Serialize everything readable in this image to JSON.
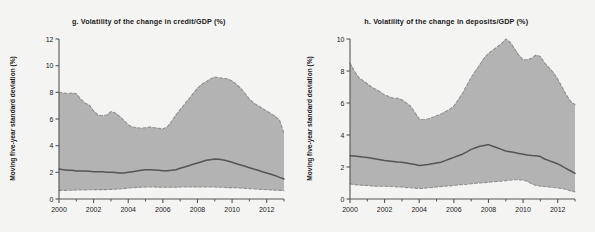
{
  "figure": {
    "background_color": "#f4f4f2",
    "band_color": "#b3b3b3",
    "line_color": "#555555",
    "dash_color": "#8f8f8f",
    "axis_color": "#555555"
  },
  "panels": [
    {
      "key": "panel-g",
      "title": "g. Volatility of the change in credit/GDP (%)",
      "ylabel": "Moving five-year standard deviation (%)"
    },
    {
      "key": "panel-h",
      "title": "h. Volatility of the change in deposits/GDP (%)",
      "ylabel": "Moving five-year standard deviation (%)"
    }
  ],
  "chart_data": [
    {
      "type": "area",
      "panel": "g",
      "title": "g. Volatility of the change in credit/GDP (%)",
      "xlabel": "",
      "ylabel": "Moving five-year standard deviation (%)",
      "xlim": [
        2000,
        2013
      ],
      "ylim": [
        0,
        12
      ],
      "yticks": [
        0,
        2,
        4,
        6,
        8,
        10,
        12
      ],
      "xticks": [
        2000,
        2002,
        2004,
        2006,
        2008,
        2010,
        2012
      ],
      "xminorticks": [
        2001,
        2003,
        2005,
        2007,
        2009,
        2011,
        2013
      ],
      "grid": false,
      "legend": "none",
      "x": [
        2000.0,
        2000.25,
        2000.5,
        2000.75,
        2001.0,
        2001.25,
        2001.5,
        2001.75,
        2002.0,
        2002.25,
        2002.5,
        2002.75,
        2003.0,
        2003.25,
        2003.5,
        2003.75,
        2004.0,
        2004.25,
        2004.5,
        2004.75,
        2005.0,
        2005.25,
        2005.5,
        2005.75,
        2006.0,
        2006.25,
        2006.5,
        2006.75,
        2007.0,
        2007.25,
        2007.5,
        2007.75,
        2008.0,
        2008.25,
        2008.5,
        2008.75,
        2009.0,
        2009.25,
        2009.5,
        2009.75,
        2010.0,
        2010.25,
        2010.5,
        2010.75,
        2011.0,
        2011.25,
        2011.5,
        2011.75,
        2012.0,
        2012.25,
        2012.5,
        2012.75,
        2013.0
      ],
      "series": [
        {
          "name": "Upper bound (75th percentile)",
          "style": "dashed",
          "values": [
            8.0,
            7.95,
            7.9,
            7.95,
            7.9,
            7.5,
            7.2,
            7.05,
            6.6,
            6.3,
            6.25,
            6.3,
            6.55,
            6.45,
            6.2,
            5.9,
            5.55,
            5.4,
            5.35,
            5.3,
            5.35,
            5.4,
            5.35,
            5.3,
            5.25,
            5.4,
            5.8,
            6.3,
            6.7,
            7.1,
            7.5,
            7.9,
            8.3,
            8.6,
            8.8,
            9.0,
            9.15,
            9.1,
            9.05,
            9.0,
            8.85,
            8.6,
            8.3,
            7.9,
            7.5,
            7.2,
            7.0,
            6.8,
            6.6,
            6.4,
            6.2,
            5.9,
            4.9
          ]
        },
        {
          "name": "Median",
          "style": "solid",
          "values": [
            2.25,
            2.2,
            2.15,
            2.15,
            2.1,
            2.1,
            2.1,
            2.08,
            2.05,
            2.05,
            2.05,
            2.0,
            2.0,
            1.98,
            1.95,
            1.95,
            2.0,
            2.05,
            2.1,
            2.15,
            2.2,
            2.2,
            2.18,
            2.15,
            2.12,
            2.12,
            2.15,
            2.2,
            2.3,
            2.4,
            2.5,
            2.6,
            2.7,
            2.8,
            2.9,
            2.95,
            3.0,
            2.98,
            2.92,
            2.85,
            2.75,
            2.65,
            2.55,
            2.45,
            2.35,
            2.25,
            2.15,
            2.05,
            1.95,
            1.85,
            1.75,
            1.62,
            1.5
          ]
        },
        {
          "name": "Lower bound (25th percentile)",
          "style": "dashed",
          "values": [
            0.65,
            0.65,
            0.65,
            0.66,
            0.67,
            0.68,
            0.68,
            0.69,
            0.7,
            0.7,
            0.7,
            0.7,
            0.72,
            0.73,
            0.75,
            0.78,
            0.82,
            0.85,
            0.87,
            0.88,
            0.9,
            0.9,
            0.9,
            0.88,
            0.88,
            0.88,
            0.88,
            0.88,
            0.9,
            0.9,
            0.9,
            0.9,
            0.9,
            0.9,
            0.9,
            0.9,
            0.9,
            0.88,
            0.88,
            0.85,
            0.85,
            0.85,
            0.82,
            0.8,
            0.78,
            0.76,
            0.74,
            0.72,
            0.7,
            0.68,
            0.66,
            0.65,
            0.62
          ]
        }
      ]
    },
    {
      "type": "area",
      "panel": "h",
      "title": "h. Volatility of the change in deposits/GDP (%)",
      "xlabel": "",
      "ylabel": "Moving five-year standard deviation (%)",
      "xlim": [
        2000,
        2013
      ],
      "ylim": [
        0,
        10
      ],
      "yticks": [
        0,
        2,
        4,
        6,
        8,
        10
      ],
      "xticks": [
        2000,
        2002,
        2004,
        2006,
        2008,
        2010,
        2012
      ],
      "xminorticks": [
        2001,
        2003,
        2005,
        2007,
        2009,
        2011,
        2013
      ],
      "grid": false,
      "legend": "none",
      "x": [
        2000.0,
        2000.25,
        2000.5,
        2000.75,
        2001.0,
        2001.25,
        2001.5,
        2001.75,
        2002.0,
        2002.25,
        2002.5,
        2002.75,
        2003.0,
        2003.25,
        2003.5,
        2003.75,
        2004.0,
        2004.25,
        2004.5,
        2004.75,
        2005.0,
        2005.25,
        2005.5,
        2005.75,
        2006.0,
        2006.25,
        2006.5,
        2006.75,
        2007.0,
        2007.25,
        2007.5,
        2007.75,
        2008.0,
        2008.25,
        2008.5,
        2008.75,
        2009.0,
        2009.25,
        2009.5,
        2009.75,
        2010.0,
        2010.25,
        2010.5,
        2010.75,
        2011.0,
        2011.25,
        2011.5,
        2011.75,
        2012.0,
        2012.25,
        2012.5,
        2012.75,
        2013.0
      ],
      "series": [
        {
          "name": "Upper bound (75th percentile)",
          "style": "dashed",
          "values": [
            8.5,
            8.0,
            7.6,
            7.4,
            7.2,
            7.0,
            6.85,
            6.7,
            6.5,
            6.4,
            6.3,
            6.3,
            6.2,
            6.0,
            5.8,
            5.4,
            5.0,
            4.95,
            5.0,
            5.1,
            5.2,
            5.3,
            5.45,
            5.6,
            5.8,
            6.2,
            6.6,
            7.1,
            7.6,
            8.0,
            8.4,
            8.8,
            9.1,
            9.3,
            9.5,
            9.7,
            10.0,
            9.8,
            9.4,
            9.0,
            8.7,
            8.7,
            8.8,
            9.0,
            8.9,
            8.5,
            8.2,
            7.9,
            7.5,
            7.0,
            6.5,
            6.1,
            5.9
          ]
        },
        {
          "name": "Median",
          "style": "solid",
          "values": [
            2.7,
            2.68,
            2.65,
            2.62,
            2.6,
            2.55,
            2.5,
            2.45,
            2.4,
            2.38,
            2.35,
            2.32,
            2.3,
            2.25,
            2.2,
            2.15,
            2.1,
            2.12,
            2.15,
            2.2,
            2.25,
            2.3,
            2.4,
            2.5,
            2.6,
            2.7,
            2.8,
            2.95,
            3.1,
            3.2,
            3.3,
            3.35,
            3.4,
            3.3,
            3.2,
            3.1,
            3.0,
            2.95,
            2.9,
            2.85,
            2.8,
            2.75,
            2.72,
            2.7,
            2.65,
            2.5,
            2.4,
            2.3,
            2.2,
            2.05,
            1.9,
            1.75,
            1.6
          ]
        },
        {
          "name": "Lower bound (25th percentile)",
          "style": "dashed",
          "values": [
            0.95,
            0.9,
            0.88,
            0.85,
            0.85,
            0.82,
            0.8,
            0.8,
            0.8,
            0.78,
            0.78,
            0.75,
            0.75,
            0.72,
            0.7,
            0.68,
            0.65,
            0.67,
            0.7,
            0.72,
            0.75,
            0.78,
            0.8,
            0.82,
            0.85,
            0.88,
            0.9,
            0.92,
            0.95,
            0.98,
            1.0,
            1.02,
            1.05,
            1.08,
            1.1,
            1.12,
            1.15,
            1.18,
            1.2,
            1.2,
            1.18,
            1.1,
            0.95,
            0.85,
            0.8,
            0.78,
            0.75,
            0.72,
            0.7,
            0.65,
            0.6,
            0.5,
            0.45
          ]
        }
      ]
    }
  ]
}
